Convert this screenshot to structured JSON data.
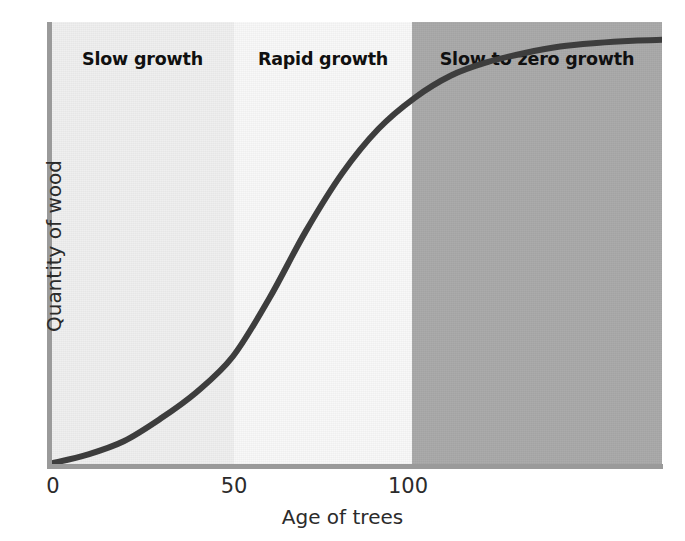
{
  "chart_data": {
    "type": "line",
    "title": "",
    "xlabel": "Age of trees",
    "ylabel": "Quantity of wood",
    "xlim": [
      0,
      168
    ],
    "ylim": [
      0,
      100
    ],
    "xticks": [
      "0",
      "50",
      "100"
    ],
    "xtick_values": [
      0,
      50,
      100
    ],
    "yticks": [],
    "grid": false,
    "legend": null,
    "annotations": [
      {
        "label": "Slow growth",
        "x_range": [
          0,
          50
        ]
      },
      {
        "label": "Rapid growth",
        "x_range": [
          50,
          100
        ]
      },
      {
        "label": "Slow to zero growth",
        "x_range": [
          100,
          168
        ]
      }
    ],
    "series": [
      {
        "name": "Quantity of wood",
        "x": [
          0,
          10,
          20,
          30,
          40,
          50,
          60,
          70,
          80,
          90,
          100,
          110,
          120,
          130,
          140,
          150,
          160,
          168
        ],
        "y": [
          1,
          3,
          6,
          11,
          17,
          25,
          38,
          53,
          66,
          76,
          83,
          88,
          91,
          93,
          94.5,
          95.3,
          95.8,
          96
        ]
      }
    ]
  },
  "chart": {
    "bands": [
      {
        "name": "slow-growth",
        "label": "Slow growth",
        "color": "#efefef"
      },
      {
        "name": "rapid-growth",
        "label": "Rapid growth",
        "color": "#f8f8f8"
      },
      {
        "name": "slow-to-zero-growth",
        "label": "Slow to zero growth",
        "color": "#a9a9a9"
      }
    ],
    "axis": {
      "x_title": "Age of trees",
      "y_title": "Quantity of wood",
      "tick_0": "0",
      "tick_50": "50",
      "tick_100": "100",
      "line_color": "#9a9a9a"
    },
    "curve": {
      "name": "growth-curve",
      "color": "#3d3d3d",
      "width": 6
    }
  }
}
